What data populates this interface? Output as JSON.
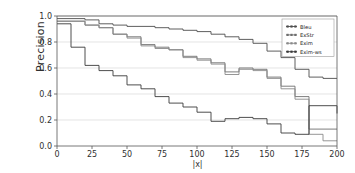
{
  "figure": {
    "ylabel": "Precision",
    "xlabel": "|x|",
    "background": "#ffffff",
    "grid_color": "#d8d8d8",
    "axis_color": "#555555"
  },
  "axes": {
    "y_ticks": [
      "0.0",
      "0.2",
      "0.4",
      "0.6",
      "0.8",
      "1.0"
    ],
    "x_ticks": [
      "0",
      "25",
      "50",
      "75",
      "100",
      "125",
      "150",
      "175",
      "200"
    ]
  },
  "legend": {
    "items": [
      {
        "label": "Bleu",
        "color": "#4d4d4d",
        "marker": "line-marker-icon"
      },
      {
        "label": "ExStr",
        "color": "#6e6e6e",
        "marker": "line-marker-icon"
      },
      {
        "label": "Exim",
        "color": "#8a8a8a",
        "marker": "line-marker-icon"
      },
      {
        "label": "Exim-ws",
        "color": "#3a3a3a",
        "marker": "line-marker-icon"
      }
    ]
  },
  "chart_data": {
    "type": "line",
    "title": "",
    "xlabel": "|x|",
    "ylabel": "Precision",
    "xlim": [
      0,
      200
    ],
    "ylim": [
      0.0,
      1.0
    ],
    "grid": true,
    "grid_axis": "y",
    "legend_position": "upper right",
    "drawstyle": "steps-post",
    "x": [
      0,
      10,
      20,
      30,
      40,
      50,
      60,
      70,
      80,
      90,
      100,
      110,
      120,
      130,
      140,
      150,
      160,
      170,
      180,
      190,
      200
    ],
    "series": [
      {
        "name": "Bleu",
        "color": "#4d4d4d",
        "values": [
          0.98,
          0.98,
          0.97,
          0.94,
          0.93,
          0.92,
          0.92,
          0.91,
          0.9,
          0.89,
          0.88,
          0.86,
          0.84,
          0.82,
          0.79,
          0.73,
          0.68,
          0.59,
          0.53,
          0.52,
          0.52
        ]
      },
      {
        "name": "ExStr",
        "color": "#6e6e6e",
        "values": [
          0.96,
          0.96,
          0.93,
          0.91,
          0.86,
          0.84,
          0.78,
          0.76,
          0.74,
          0.69,
          0.67,
          0.64,
          0.57,
          0.6,
          0.59,
          0.53,
          0.46,
          0.38,
          0.13,
          0.13,
          0.13
        ]
      },
      {
        "name": "Exim",
        "color": "#8a8a8a",
        "values": [
          0.96,
          0.96,
          0.93,
          0.91,
          0.86,
          0.83,
          0.77,
          0.75,
          0.74,
          0.68,
          0.66,
          0.63,
          0.55,
          0.59,
          0.58,
          0.52,
          0.44,
          0.36,
          0.09,
          0.04,
          0.04
        ]
      },
      {
        "name": "Exim-ws",
        "color": "#3a3a3a",
        "values": [
          0.94,
          0.76,
          0.62,
          0.58,
          0.54,
          0.47,
          0.44,
          0.38,
          0.33,
          0.3,
          0.26,
          0.19,
          0.21,
          0.22,
          0.21,
          0.17,
          0.1,
          0.09,
          0.31,
          0.31,
          0.25
        ]
      }
    ]
  }
}
